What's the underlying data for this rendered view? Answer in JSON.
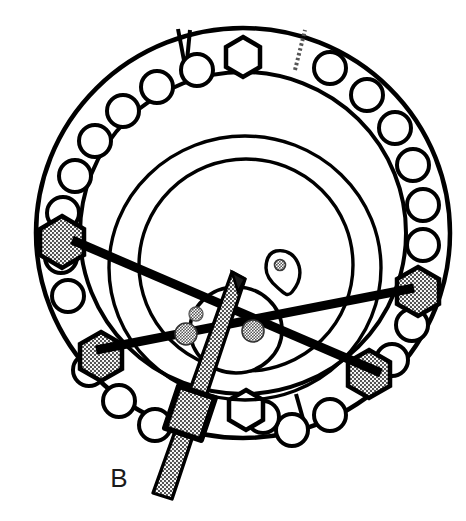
{
  "figure": {
    "label": "B",
    "caption_letter": "B",
    "type": "anatomical-cross-section-diagram",
    "background_color": "#ffffff",
    "line_color": "#000000",
    "hatch_color": "#808080"
  },
  "ring": {
    "name": "outer-annular-ring",
    "center_x": 243,
    "center_y": 233,
    "outer_radius_x": 207,
    "outer_radius_y": 205,
    "inner_radius_x": 163,
    "inner_radius_y": 161,
    "stroke_width": 4
  },
  "inner_circles": [
    {
      "name": "inner-circle-large",
      "cx": 243,
      "cy": 228,
      "rx": 122,
      "ry": 120,
      "stroke_width": 3
    },
    {
      "name": "inner-circle-medium",
      "cx": 243,
      "cy": 252,
      "rx": 100,
      "ry": 98,
      "stroke_width": 3
    }
  ],
  "small_structure": {
    "name": "central-oval-structure",
    "cx": 236,
    "cy": 328,
    "rx": 45,
    "ry": 42,
    "stroke_width": 3
  },
  "lesion": {
    "name": "lesion-marker",
    "cx": 279,
    "cy": 270,
    "width": 30,
    "height": 38,
    "inner_dot_r": 5
  },
  "ring_holes": {
    "count": 26,
    "hole_radius": 16,
    "ring_mid_radius_x": 185,
    "ring_mid_radius_y": 183,
    "description": "evenly spaced circular screw holes around the annulus"
  },
  "hexagons": [
    {
      "name": "hexagon-top-marker",
      "angle_deg": -90,
      "shaded": false,
      "radius": 19
    },
    {
      "name": "hexagon-bottom-marker",
      "angle_deg": 90,
      "shaded": false,
      "radius": 19
    },
    {
      "name": "hexagon-upper-left-anchor",
      "angle_deg": 188,
      "shaded": true,
      "radius": 22
    },
    {
      "name": "hexagon-lower-left-anchor",
      "angle_deg": 147,
      "shaded": true,
      "radius": 21
    },
    {
      "name": "hexagon-upper-right-anchor",
      "angle_deg": 12,
      "shaded": true,
      "radius": 22
    },
    {
      "name": "hexagon-lower-right-anchor",
      "angle_deg": 36,
      "shaded": true,
      "radius": 21
    }
  ],
  "radial_dividers": [
    {
      "name": "divider-top-left-solid",
      "angle_deg": -108,
      "style": "solid"
    },
    {
      "name": "divider-top-right-dotted",
      "angle_deg": -71,
      "style": "dotted"
    },
    {
      "name": "divider-bottom-left-dotted",
      "angle_deg": 108,
      "style": "dotted"
    },
    {
      "name": "divider-bottom-right-solid",
      "angle_deg": 70,
      "style": "solid"
    }
  ],
  "guide_wires": [
    {
      "name": "guide-wire-upper-left-to-lower-right",
      "x1": 68,
      "y1": 240,
      "x2": 378,
      "y2": 372,
      "stroke_width": 9
    },
    {
      "name": "guide-wire-lower-left-to-upper-right",
      "x1": 92,
      "y1": 348,
      "x2": 412,
      "y2": 287,
      "stroke_width": 9
    }
  ],
  "node_dots": [
    {
      "name": "node-dot-left",
      "cx": 186,
      "cy": 333,
      "r": 11
    },
    {
      "name": "node-dot-right",
      "cx": 253,
      "cy": 332,
      "r": 11
    },
    {
      "name": "node-dot-small-upper",
      "cx": 196,
      "cy": 316,
      "r": 7
    }
  ],
  "rod": {
    "name": "surgical-rod",
    "tip_x": 236,
    "tip_y": 269,
    "end_x": 160,
    "end_y": 495,
    "width": 17,
    "collar": {
      "name": "rod-collar-block",
      "cx": 194,
      "cy": 410,
      "width": 34,
      "height": 46,
      "rotation_deg": -18
    }
  },
  "label_position": {
    "name": "figure-label",
    "x": 119,
    "y": 487
  }
}
